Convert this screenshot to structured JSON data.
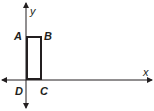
{
  "diagram": {
    "axes": {
      "x_label": "x",
      "y_label": "y",
      "color": "#231f20"
    },
    "rectangle": {
      "color": "#231f20",
      "vertices": [
        {
          "name": "A",
          "label": "A"
        },
        {
          "name": "B",
          "label": "B"
        },
        {
          "name": "C",
          "label": "C"
        },
        {
          "name": "D",
          "label": "D"
        }
      ]
    }
  }
}
